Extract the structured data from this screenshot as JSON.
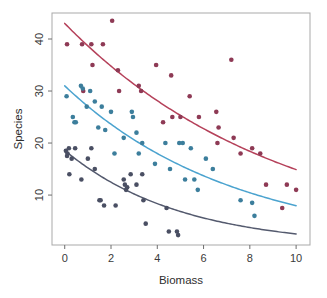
{
  "chart_data": {
    "type": "scatter",
    "title": "",
    "xlabel": "Biomass",
    "ylabel": "Species",
    "xlim": [
      -0.55,
      10.6
    ],
    "ylim": [
      0.4,
      45.0
    ],
    "xticks": [
      0,
      2,
      4,
      6,
      8,
      10
    ],
    "yticks": [
      10,
      20,
      30,
      40
    ],
    "grid": false,
    "legend": "none",
    "frame": "box",
    "colors": {
      "high": "#b5415a",
      "mid": "#4ba3cf",
      "low": "#545a6e",
      "frame": "#a9a9a9",
      "text": "#2e2e2e",
      "background": "#ffffff"
    },
    "series": [
      {
        "name": "high",
        "label": "pH high",
        "color": "#b5415a",
        "point_color": "#8e3a55",
        "fit": {
          "type": "exponential",
          "intercept": 43.0,
          "rate": 0.106
        },
        "points": [
          {
            "x": 0.1,
            "y": 39
          },
          {
            "x": 0.75,
            "y": 39
          },
          {
            "x": 0.8,
            "y": 30
          },
          {
            "x": 1.15,
            "y": 39
          },
          {
            "x": 1.2,
            "y": 35
          },
          {
            "x": 1.65,
            "y": 39
          },
          {
            "x": 2.05,
            "y": 43.5
          },
          {
            "x": 2.3,
            "y": 34
          },
          {
            "x": 2.35,
            "y": 30
          },
          {
            "x": 3.2,
            "y": 31
          },
          {
            "x": 3.3,
            "y": 30
          },
          {
            "x": 3.95,
            "y": 35
          },
          {
            "x": 4.25,
            "y": 24
          },
          {
            "x": 4.6,
            "y": 33
          },
          {
            "x": 4.65,
            "y": 25
          },
          {
            "x": 5.0,
            "y": 25
          },
          {
            "x": 5.4,
            "y": 29
          },
          {
            "x": 5.8,
            "y": 25
          },
          {
            "x": 6.55,
            "y": 26
          },
          {
            "x": 6.6,
            "y": 20
          },
          {
            "x": 6.65,
            "y": 23
          },
          {
            "x": 7.2,
            "y": 36
          },
          {
            "x": 7.3,
            "y": 21
          },
          {
            "x": 7.6,
            "y": 18
          },
          {
            "x": 8.1,
            "y": 19
          },
          {
            "x": 8.45,
            "y": 18
          },
          {
            "x": 8.7,
            "y": 12
          },
          {
            "x": 9.4,
            "y": 7.5
          },
          {
            "x": 9.6,
            "y": 12
          },
          {
            "x": 10.0,
            "y": 11
          }
        ]
      },
      {
        "name": "mid",
        "label": "pH mid",
        "color": "#4ba3cf",
        "point_color": "#3c7e9c",
        "fit": {
          "type": "exponential",
          "intercept": 31.0,
          "rate": 0.136
        },
        "points": [
          {
            "x": 0.08,
            "y": 29
          },
          {
            "x": 0.35,
            "y": 25
          },
          {
            "x": 0.42,
            "y": 24
          },
          {
            "x": 0.48,
            "y": 24
          },
          {
            "x": 0.7,
            "y": 31
          },
          {
            "x": 0.78,
            "y": 30.5
          },
          {
            "x": 0.95,
            "y": 27
          },
          {
            "x": 1.1,
            "y": 30
          },
          {
            "x": 1.3,
            "y": 28
          },
          {
            "x": 1.45,
            "y": 23
          },
          {
            "x": 1.6,
            "y": 27
          },
          {
            "x": 1.75,
            "y": 22.5
          },
          {
            "x": 2.0,
            "y": 26
          },
          {
            "x": 2.15,
            "y": 18
          },
          {
            "x": 2.55,
            "y": 21
          },
          {
            "x": 2.9,
            "y": 26
          },
          {
            "x": 2.95,
            "y": 25
          },
          {
            "x": 3.1,
            "y": 22
          },
          {
            "x": 3.2,
            "y": 18
          },
          {
            "x": 3.35,
            "y": 20
          },
          {
            "x": 3.9,
            "y": 16
          },
          {
            "x": 4.35,
            "y": 20
          },
          {
            "x": 4.55,
            "y": 15
          },
          {
            "x": 4.95,
            "y": 20
          },
          {
            "x": 5.1,
            "y": 20
          },
          {
            "x": 5.2,
            "y": 13
          },
          {
            "x": 5.45,
            "y": 19
          },
          {
            "x": 5.6,
            "y": 13
          },
          {
            "x": 5.75,
            "y": 11
          },
          {
            "x": 6.1,
            "y": 17
          },
          {
            "x": 6.4,
            "y": 15
          },
          {
            "x": 7.6,
            "y": 9
          },
          {
            "x": 8.1,
            "y": 8.5
          },
          {
            "x": 8.2,
            "y": 6
          }
        ]
      },
      {
        "name": "low",
        "label": "pH low",
        "color": "#545a6e",
        "point_color": "#4a4f63",
        "fit": {
          "type": "exponential",
          "intercept": 18.6,
          "rate": 0.2
        },
        "points": [
          {
            "x": 0.05,
            "y": 18.5
          },
          {
            "x": 0.1,
            "y": 17.5
          },
          {
            "x": 0.12,
            "y": 18
          },
          {
            "x": 0.18,
            "y": 19
          },
          {
            "x": 0.2,
            "y": 14
          },
          {
            "x": 0.3,
            "y": 17
          },
          {
            "x": 0.45,
            "y": 19
          },
          {
            "x": 0.72,
            "y": 13
          },
          {
            "x": 1.0,
            "y": 17
          },
          {
            "x": 1.15,
            "y": 19
          },
          {
            "x": 1.3,
            "y": 15
          },
          {
            "x": 1.5,
            "y": 9
          },
          {
            "x": 1.55,
            "y": 9
          },
          {
            "x": 1.7,
            "y": 8
          },
          {
            "x": 2.2,
            "y": 8
          },
          {
            "x": 2.55,
            "y": 13
          },
          {
            "x": 2.6,
            "y": 12
          },
          {
            "x": 2.65,
            "y": 11
          },
          {
            "x": 2.7,
            "y": 11.5
          },
          {
            "x": 2.85,
            "y": 14
          },
          {
            "x": 3.1,
            "y": 12
          },
          {
            "x": 3.35,
            "y": 14
          },
          {
            "x": 3.4,
            "y": 9
          },
          {
            "x": 3.5,
            "y": 4.5
          },
          {
            "x": 4.4,
            "y": 7.5
          },
          {
            "x": 4.5,
            "y": 3
          },
          {
            "x": 4.85,
            "y": 3
          },
          {
            "x": 4.9,
            "y": 2.3
          }
        ]
      }
    ]
  }
}
